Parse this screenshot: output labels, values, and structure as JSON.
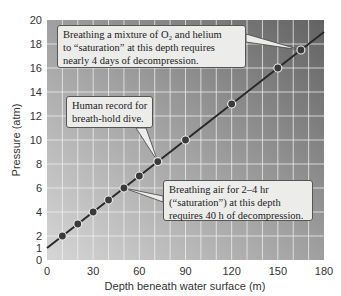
{
  "chart_data": {
    "type": "scatter",
    "title": "",
    "xlabel": "Depth beneath water surface (m)",
    "ylabel": "Pressure (atm)",
    "xlim": [
      0,
      180
    ],
    "ylim": [
      0,
      20
    ],
    "x_ticks": [
      0,
      30,
      60,
      90,
      120,
      150,
      180
    ],
    "y_ticks": [
      0,
      1,
      2,
      4,
      6,
      8,
      10,
      12,
      14,
      16,
      18,
      20
    ],
    "grid": true,
    "grid_x_step": 10,
    "grid_y_step": 2,
    "series": [
      {
        "name": "Pressure vs depth",
        "x": [
          10,
          20,
          30,
          40,
          50,
          60,
          72,
          90,
          120,
          150,
          165
        ],
        "y": [
          2,
          3,
          4,
          5,
          6,
          7,
          8.2,
          10,
          13,
          16,
          17.5
        ]
      }
    ],
    "trend_line": {
      "x": [
        0,
        180
      ],
      "y": [
        1,
        19
      ]
    },
    "annotations": [
      {
        "id": "helium",
        "lines": [
          "Breathing a mixture of O₂ and helium",
          "to “saturation” at this depth requires",
          "nearly 4 days of decompression."
        ],
        "points_to": [
          165,
          17.5
        ]
      },
      {
        "id": "breath-hold",
        "lines": [
          "Human record for",
          "breath-hold dive."
        ],
        "points_to": [
          72,
          8.2
        ]
      },
      {
        "id": "air",
        "lines": [
          "Breathing air for 2–4 hr",
          "(“saturation”) at this depth",
          "requires 40 h of decompression."
        ],
        "points_to": [
          50,
          6
        ]
      }
    ]
  },
  "colors": {
    "plot_bg_light": "#d2d2d2",
    "plot_bg_dark": "#6a6a6a",
    "grid": "#f2f2f2",
    "line": "#2a2a2a",
    "point_fill": "#3a3a3a",
    "callout_bg": "#ececea"
  }
}
